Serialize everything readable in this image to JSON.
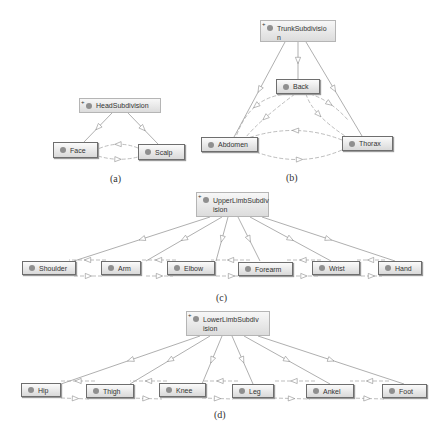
{
  "diagrams": [
    {
      "id": "a",
      "caption": "(a)",
      "parent": {
        "label": "HeadSubdivision",
        "expand_glyph": "+"
      },
      "children": [
        {
          "label": "Face"
        },
        {
          "label": "Scalp"
        }
      ]
    },
    {
      "id": "b",
      "caption": "(b)",
      "parent": {
        "label": "TrunkSubdivisio\nn",
        "expand_glyph": "+"
      },
      "children": [
        {
          "label": "Back"
        },
        {
          "label": "Abdomen"
        },
        {
          "label": "Thorax"
        }
      ]
    },
    {
      "id": "c",
      "caption": "(c)",
      "parent": {
        "label": "UpperLimbSubdiv\nision",
        "expand_glyph": "+"
      },
      "children": [
        {
          "label": "Shoulder"
        },
        {
          "label": "Arm"
        },
        {
          "label": "Elbow"
        },
        {
          "label": "Forearm"
        },
        {
          "label": "Wrist"
        },
        {
          "label": "Hand"
        }
      ]
    },
    {
      "id": "d",
      "caption": "(d)",
      "parent": {
        "label": "LowerLimbSubdiv\nision",
        "expand_glyph": "+"
      },
      "children": [
        {
          "label": "Hip"
        },
        {
          "label": "Thigh"
        },
        {
          "label": "Knee"
        },
        {
          "label": "Leg"
        },
        {
          "label": "Ankel"
        },
        {
          "label": "Foot"
        }
      ]
    }
  ],
  "colors": {
    "edge": "#8c8c8c",
    "dashed_edge": "#a0a0a0",
    "node_border": "#6e6e6e",
    "dot": "#8f8f8f"
  }
}
